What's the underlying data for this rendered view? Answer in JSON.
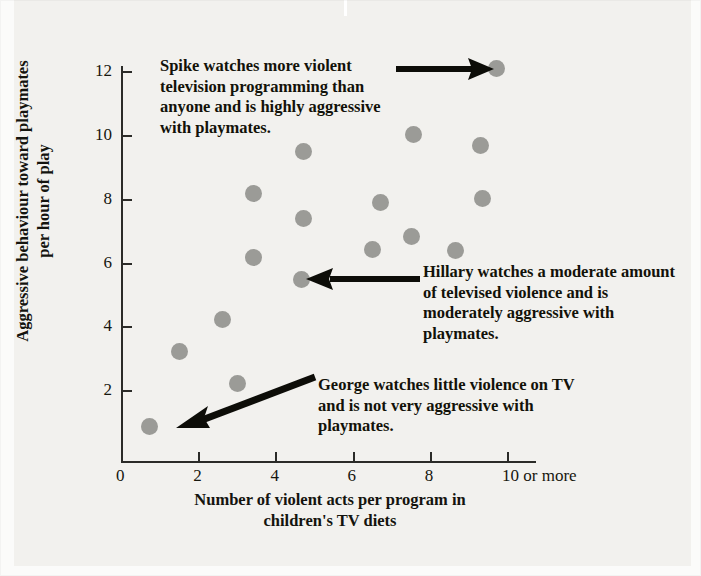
{
  "chart_data": {
    "type": "scatter",
    "title": "",
    "xlabel": "Number of violent acts per program in children's TV diets",
    "ylabel": "Aggressive behaviour toward playmates per hour of play",
    "xlim": [
      0,
      10
    ],
    "ylim": [
      0,
      12
    ],
    "grid": false,
    "legend": "none",
    "x_ticks": [
      0,
      2,
      4,
      6,
      8,
      10
    ],
    "x_tick_labels": [
      "0",
      "2",
      "4",
      "6",
      "8",
      "10 or more"
    ],
    "y_ticks": [
      2,
      4,
      6,
      8,
      10,
      12
    ],
    "y_tick_labels": [
      "2",
      "4",
      "6",
      "8",
      "10",
      "12"
    ],
    "marker_color": "#9b9b97",
    "points": [
      {
        "x": 0.7,
        "y": 0.9,
        "label": "George"
      },
      {
        "x": 1.5,
        "y": 3.25,
        "label": ""
      },
      {
        "x": 2.6,
        "y": 4.25,
        "label": ""
      },
      {
        "x": 3.0,
        "y": 2.25,
        "label": ""
      },
      {
        "x": 3.4,
        "y": 6.2,
        "label": ""
      },
      {
        "x": 3.4,
        "y": 8.2,
        "label": ""
      },
      {
        "x": 4.65,
        "y": 5.5,
        "label": "Hillary"
      },
      {
        "x": 4.7,
        "y": 7.4,
        "label": ""
      },
      {
        "x": 4.7,
        "y": 9.5,
        "label": ""
      },
      {
        "x": 6.5,
        "y": 6.45,
        "label": ""
      },
      {
        "x": 6.7,
        "y": 7.9,
        "label": ""
      },
      {
        "x": 7.5,
        "y": 6.85,
        "label": ""
      },
      {
        "x": 7.55,
        "y": 10.05,
        "label": ""
      },
      {
        "x": 8.65,
        "y": 6.4,
        "label": ""
      },
      {
        "x": 9.35,
        "y": 8.05,
        "label": ""
      },
      {
        "x": 9.3,
        "y": 9.7,
        "label": ""
      },
      {
        "x": 9.7,
        "y": 12.1,
        "label": "Spike"
      }
    ]
  },
  "axes": {
    "x_title_line1": "Number of violent acts per program in",
    "x_title_line2": "children's TV diets",
    "y_title_line1": "Aggressive behaviour toward playmates",
    "y_title_line2": "per hour of play"
  },
  "annotations": {
    "spike": "Spike watches more violent television programming than anyone and is highly aggressive with playmates.",
    "hillary": "Hillary watches a moderate amount of televised violence and is moderately aggressive with playmates.",
    "george": "George watches little violence on TV and is not very aggressive with playmates."
  },
  "colors": {
    "marker": "#9b9b97",
    "axis": "#2b2b28",
    "text": "#14140e",
    "background": "#f2f1ee"
  }
}
